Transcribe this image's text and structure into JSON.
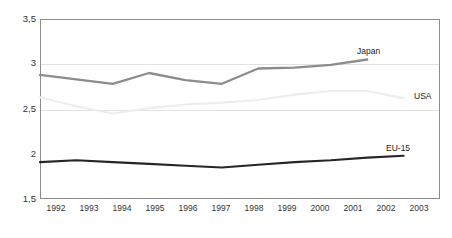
{
  "chart_data": {
    "type": "line",
    "title": "",
    "xlabel": "",
    "ylabel": "",
    "x": [
      1992,
      1993,
      1994,
      1995,
      1996,
      1997,
      1998,
      1999,
      2000,
      2001,
      2002,
      2003
    ],
    "categories": [
      "1992",
      "1993",
      "1994",
      "1995",
      "1996",
      "1997",
      "1998",
      "1999",
      "2000",
      "2001",
      "2002",
      "2003"
    ],
    "xlim": [
      1992,
      2003
    ],
    "ylim": [
      1.5,
      3.5
    ],
    "yticks": [
      1.5,
      2.0,
      2.5,
      3.0,
      3.5
    ],
    "ytick_labels": [
      "1,5",
      "2",
      "2,5",
      "3",
      "3,5"
    ],
    "grid": true,
    "gridlines_at": [
      2.5,
      3.0
    ],
    "legend": "inline-end-labels",
    "series": [
      {
        "name": "Japan",
        "color": "#8c8c8c",
        "label": "Japan",
        "x": [
          1992,
          1993,
          1994,
          1995,
          1996,
          1997,
          1998,
          1999,
          2000,
          2001
        ],
        "values": [
          2.88,
          2.83,
          2.78,
          2.9,
          2.82,
          2.78,
          2.95,
          2.96,
          2.99,
          3.05
        ]
      },
      {
        "name": "USA",
        "color": "#ededed",
        "label": "USA",
        "x": [
          1992,
          1993,
          1994,
          1995,
          1996,
          1997,
          1998,
          1999,
          2000,
          2001,
          2002
        ],
        "values": [
          2.63,
          2.53,
          2.45,
          2.51,
          2.55,
          2.57,
          2.6,
          2.66,
          2.7,
          2.7,
          2.62
        ]
      },
      {
        "name": "EU-15",
        "color": "#262626",
        "label": "EU-15",
        "x": [
          1992,
          1993,
          1994,
          1995,
          1996,
          1997,
          1998,
          1999,
          2000,
          2001,
          2002
        ],
        "values": [
          1.91,
          1.93,
          1.91,
          1.89,
          1.87,
          1.85,
          1.88,
          1.91,
          1.93,
          1.96,
          1.98
        ]
      }
    ]
  },
  "axes": {
    "y_labels": [
      {
        "text": "3,5",
        "value": 3.5
      },
      {
        "text": "3",
        "value": 3.0
      },
      {
        "text": "2,5",
        "value": 2.5
      },
      {
        "text": "2",
        "value": 2.0
      },
      {
        "text": "1,5",
        "value": 1.5
      }
    ],
    "x_labels": [
      "1992",
      "1993",
      "1994",
      "1995",
      "1996",
      "1997",
      "1998",
      "1999",
      "2000",
      "2001",
      "2002",
      "2003"
    ]
  },
  "series_labels": [
    {
      "text": "Japan",
      "series": "Japan"
    },
    {
      "text": "USA",
      "series": "USA"
    },
    {
      "text": "EU-15",
      "series": "EU-15"
    }
  ],
  "colors": {
    "frame": "#8c8c8c",
    "grid": "#e2e2e2",
    "japan": "#8c8c8c",
    "usa": "#ededed",
    "eu15": "#262626",
    "text": "#333333",
    "background": "#ffffff"
  }
}
